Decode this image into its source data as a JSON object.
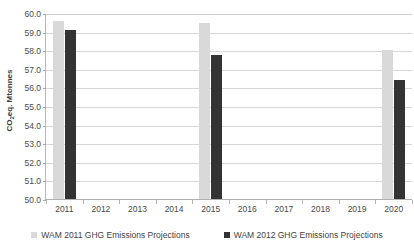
{
  "chart_data": {
    "type": "bar",
    "title": "",
    "xlabel": "",
    "ylabel": "CO2eq. Mtonnes",
    "ylabel_parts": {
      "prefix": "CO",
      "sub": "2",
      "suffix": "eq. Mtonnes"
    },
    "categories": [
      "2011",
      "2012",
      "2013",
      "2014",
      "2015",
      "2016",
      "2017",
      "2018",
      "2019",
      "2020"
    ],
    "series": [
      {
        "name": "WAM 2011 GHG Emissions Projections",
        "color": "#d9d9d9",
        "values": [
          59.6,
          null,
          null,
          null,
          59.5,
          null,
          null,
          null,
          null,
          58.05
        ]
      },
      {
        "name": "WAM 2012 GHG Emissions Projections",
        "color": "#333333",
        "values": [
          59.15,
          null,
          null,
          null,
          57.8,
          null,
          null,
          null,
          null,
          56.45
        ]
      }
    ],
    "ylim": [
      50.0,
      60.0
    ],
    "ytick_step": 1.0,
    "yticks": [
      "60.0",
      "59.0",
      "58.0",
      "57.0",
      "56.0",
      "55.0",
      "54.0",
      "53.0",
      "52.0",
      "51.0",
      "50.0"
    ],
    "grid": true,
    "legend_position": "bottom"
  },
  "legend": {
    "items": [
      {
        "label": "WAM 2011 GHG Emissions Projections",
        "color": "#d9d9d9"
      },
      {
        "label": "WAM 2012 GHG Emissions Projections",
        "color": "#333333"
      }
    ]
  },
  "colors": {
    "series_a": "#d9d9d9",
    "series_b": "#333333",
    "gridline": "#d6d6d6",
    "axis": "#b0b0b0",
    "text": "#494949",
    "background": "#ffffff"
  }
}
